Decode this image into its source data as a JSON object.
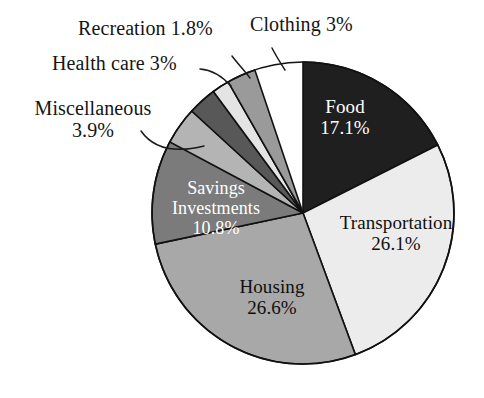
{
  "chart_data": {
    "type": "pie",
    "title": "",
    "subtitle": "",
    "xlabel": "",
    "ylabel": "",
    "legend_position": "none",
    "grid": false,
    "value_unit": "percent",
    "categories": [
      "Food",
      "Transportation",
      "Housing",
      "Savings Investments",
      "Miscellaneous",
      "Health care",
      "Recreation",
      "Clothing"
    ],
    "values": [
      17.1,
      26.1,
      26.6,
      10.8,
      3.9,
      3.0,
      1.8,
      3.0
    ],
    "slices": [
      {
        "name": "Food",
        "label_lines": [
          "Food",
          "17.1%"
        ],
        "value": 17.1,
        "value_text": "17.1%",
        "color": "#1f1f1f",
        "text_color": "#ffffff",
        "label_placement": "inside",
        "start_angle": 0,
        "end_angle": 63.2
      },
      {
        "name": "Transportation",
        "label_lines": [
          "Transportation",
          "26.1%"
        ],
        "value": 26.1,
        "value_text": "26.1%",
        "color": "#ececec",
        "text_color": "#101010",
        "label_placement": "inside",
        "start_angle": 63.2,
        "end_angle": 159.7
      },
      {
        "name": "Housing",
        "label_lines": [
          "Housing",
          "26.6%"
        ],
        "value": 26.6,
        "value_text": "26.6%",
        "color": "#a8a8a8",
        "text_color": "#101010",
        "label_placement": "inside",
        "start_angle": 159.7,
        "end_angle": 258.1
      },
      {
        "name": "Savings Investments",
        "label_lines": [
          "Savings",
          "Investments",
          "10.8%"
        ],
        "value": 10.8,
        "value_text": "10.8%",
        "color": "#7b7b7b",
        "text_color": "#ffffff",
        "label_placement": "inside",
        "start_angle": 258.1,
        "end_angle": 298.1
      },
      {
        "name": "Miscellaneous",
        "label_lines": [
          "Miscellaneous",
          "3.9%"
        ],
        "value": 3.9,
        "value_text": "3.9%",
        "color": "#b4b4b4",
        "text_color": "#101010",
        "label_placement": "outside",
        "start_angle": 298.1,
        "end_angle": 312.5
      },
      {
        "name": "Health care",
        "label_lines": [
          "Health care 3%"
        ],
        "value": 3.0,
        "value_text": "3%",
        "color": "#585858",
        "text_color": "#101010",
        "label_placement": "outside",
        "start_angle": 312.5,
        "end_angle": 323.6
      },
      {
        "name": "Recreation",
        "label_lines": [
          "Recreation 1.8%"
        ],
        "value": 1.8,
        "value_text": "1.8%",
        "color": "#e4e4e4",
        "text_color": "#101010",
        "label_placement": "outside",
        "start_angle": 323.6,
        "end_angle": 330.3
      },
      {
        "name": "Clothing",
        "label_lines": [
          "Clothing 3%"
        ],
        "value": 3.0,
        "value_text": "3%",
        "color": "#9a9a9a",
        "text_color": "#101010",
        "label_placement": "outside",
        "start_angle": 330.3,
        "end_angle": 341.4
      }
    ],
    "geometry": {
      "center_x": 303,
      "center_y": 213,
      "radius": 151,
      "stroke_color": "#111111",
      "stroke_width": 1.6,
      "background": "#ffffff"
    }
  },
  "labels": {
    "food": {
      "line1": "Food",
      "line2": "17.1%"
    },
    "transportation": {
      "line1": "Transportation",
      "line2": "26.1%"
    },
    "housing": {
      "line1": "Housing",
      "line2": "26.6%"
    },
    "savings": {
      "line1": "Savings",
      "line2": "Investments",
      "line3": "10.8%"
    },
    "miscellaneous": {
      "line1": "Miscellaneous",
      "line2": "3.9%"
    },
    "health_care": {
      "line1": "Health care 3%"
    },
    "recreation": {
      "line1": "Recreation 1.8%"
    },
    "clothing": {
      "line1": "Clothing 3%"
    }
  }
}
